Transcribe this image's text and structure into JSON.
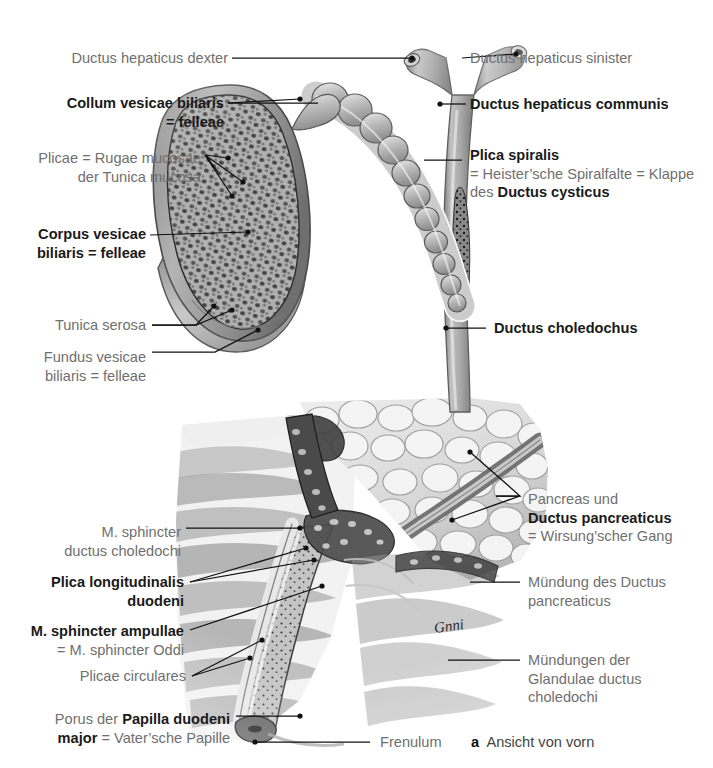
{
  "figure": {
    "caption_letter": "a",
    "caption_text": "Ansicht von vorn",
    "artist_signature": "Gnni"
  },
  "labels": {
    "ductus_hepaticus_dexter": {
      "lines": [
        {
          "t": "Ductus hepaticus dexter",
          "w": "normal"
        }
      ]
    },
    "collum_vesicae": {
      "lines": [
        {
          "t": "Collum vesicae biliaris",
          "w": "bold"
        },
        {
          "t": "= felleae",
          "w": "bold"
        }
      ]
    },
    "plicae_rugae": {
      "lines": [
        {
          "t": "Plicae = Rugae mucosae",
          "w": "normal"
        },
        {
          "t": "der Tunica mucosa",
          "w": "normal"
        }
      ]
    },
    "corpus_vesicae": {
      "lines": [
        {
          "t": "Corpus vesicae",
          "w": "bold"
        },
        {
          "t": "biliaris = felleae",
          "w": "bold"
        }
      ]
    },
    "tunica_serosa": {
      "lines": [
        {
          "t": "Tunica serosa",
          "w": "normal"
        }
      ]
    },
    "fundus_vesicae": {
      "lines": [
        {
          "t": "Fundus vesicae",
          "w": "normal"
        },
        {
          "t": "biliaris = felleae",
          "w": "normal"
        }
      ]
    },
    "m_sphincter_ductus_choledochi": {
      "lines": [
        {
          "t": "M. sphincter",
          "w": "normal"
        },
        {
          "t": "ductus choledochi",
          "w": "normal"
        }
      ]
    },
    "plica_longitudinalis": {
      "lines": [
        {
          "t": "Plica longitudinalis",
          "w": "bold"
        },
        {
          "t": "duodeni",
          "w": "bold"
        }
      ]
    },
    "m_sphincter_ampullae": {
      "lines": [
        {
          "t": "M. sphincter ampullae",
          "w": "bold"
        },
        {
          "t": "= M. sphincter Oddi",
          "w": "normal"
        }
      ]
    },
    "plicae_circulares": {
      "lines": [
        {
          "t": "Plicae circulares",
          "w": "normal"
        }
      ]
    },
    "porus_papilla": {
      "line1_pre": "Porus der ",
      "line1_bold": "Papilla duodeni",
      "line2_bold": "major",
      "line2_post": " = Vater’sche Papille"
    },
    "frenulum": {
      "lines": [
        {
          "t": "Frenulum",
          "w": "normal"
        }
      ]
    },
    "ductus_hepaticus_sinister": {
      "lines": [
        {
          "t": "Ductus hepaticus sinister",
          "w": "normal"
        }
      ]
    },
    "ductus_hepaticus_communis": {
      "lines": [
        {
          "t": "Ductus hepaticus communis",
          "w": "bold"
        }
      ]
    },
    "plica_spiralis": {
      "line1": "Plica spiralis",
      "line2": "= Heister’sche Spiralfalte = Klappe",
      "line3_pre": "des ",
      "line3_bold": "Ductus cysticus"
    },
    "ductus_choledochus": {
      "lines": [
        {
          "t": "Ductus choledochus",
          "w": "bold"
        }
      ]
    },
    "pancreas_und": {
      "line1": "Pancreas und",
      "line2_bold": "Ductus pancreaticus",
      "line3": "= Wirsung’scher Gang"
    },
    "muendung_ductus_pancreaticus": {
      "lines": [
        {
          "t": "Mündung des Ductus",
          "w": "normal"
        },
        {
          "t": "pancreaticus",
          "w": "normal"
        }
      ]
    },
    "muendungen_glandulae": {
      "lines": [
        {
          "t": "Mündungen der",
          "w": "normal"
        },
        {
          "t": "Glandulae ductus",
          "w": "normal"
        },
        {
          "t": "choledochi",
          "w": "normal"
        }
      ]
    }
  },
  "colors": {
    "grey_text": "#6f6f6f",
    "dark_text": "#1a1a1a",
    "leader": "#111111",
    "background": "#ffffff"
  }
}
